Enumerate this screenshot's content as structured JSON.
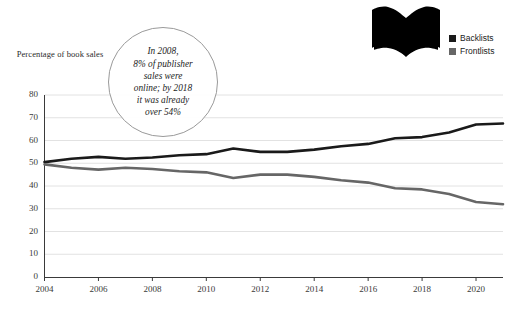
{
  "axis": {
    "y_title": "Percentage\nof book sales",
    "y_ticks": [
      "80",
      "70",
      "60",
      "50",
      "40",
      "30",
      "20",
      "10",
      "0"
    ],
    "x_ticks": [
      "2004",
      "2006",
      "2008",
      "2010",
      "2012",
      "2014",
      "2016",
      "2018",
      "2020"
    ]
  },
  "callout": {
    "text": "In 2008,\n8% of publisher\nsales were\nonline; by 2018\nit was already\nover 54%"
  },
  "legend": {
    "items": [
      {
        "label": "Backlists",
        "color": "#1a1a1a"
      },
      {
        "label": "Frontlists",
        "color": "#666666"
      }
    ]
  },
  "icon": {
    "name": "open-book-icon",
    "color": "#000000"
  },
  "chart_data": {
    "type": "line",
    "title": "",
    "xlabel": "",
    "ylabel": "Percentage of book sales",
    "xlim": [
      2004,
      2021
    ],
    "ylim": [
      0,
      80
    ],
    "grid": true,
    "legend_position": "top-right",
    "x": [
      2004,
      2005,
      2006,
      2007,
      2008,
      2009,
      2010,
      2011,
      2012,
      2013,
      2014,
      2015,
      2016,
      2017,
      2018,
      2019,
      2020,
      2021
    ],
    "series": [
      {
        "name": "Backlists",
        "color": "#1a1a1a",
        "values": [
          50.5,
          52.0,
          52.8,
          52.0,
          52.5,
          53.5,
          54.0,
          56.5,
          55.0,
          55.0,
          56.0,
          57.5,
          58.5,
          61.0,
          61.5,
          63.5,
          67.0,
          67.5
        ]
      },
      {
        "name": "Frontlists",
        "color": "#666666",
        "values": [
          49.5,
          48.0,
          47.2,
          48.0,
          47.5,
          46.5,
          46.0,
          43.5,
          45.0,
          45.0,
          44.0,
          42.5,
          41.5,
          39.0,
          38.5,
          36.5,
          33.0,
          32.0
        ]
      }
    ],
    "annotations": [
      {
        "text": "In 2008, 8% of publisher sales were online; by 2018 it was already over 54%",
        "shape": "circle"
      }
    ]
  }
}
